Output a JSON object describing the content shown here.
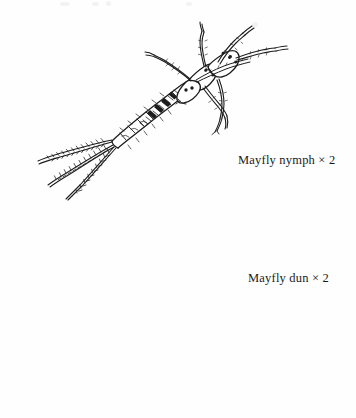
{
  "page": {
    "background_color": "#fefefe",
    "ink_color": "#1a1a1a",
    "width": 356,
    "height": 418,
    "kind": "scanned-illustration-plate"
  },
  "figures": [
    {
      "id": "mayfly-nymph",
      "caption": "Mayfly nymph  × 2",
      "subject": "Mayfly nymph",
      "magnification": "× 2",
      "orientation": "diagonal, head upper-right, tails lower-left",
      "tails": 3,
      "legs": 6,
      "style": "pen-and-ink line drawing"
    },
    {
      "id": "mayfly-dun",
      "caption": "Mayfly dun  × 2",
      "subject": "Mayfly dun",
      "magnification": "× 2",
      "orientation": "side view, head lower-left, tails sweeping upper-right",
      "tails": 3,
      "legs": 6,
      "wings": "large speckled upright forewing with smaller hindwing",
      "style": "pen-and-ink line drawing"
    }
  ],
  "captions": {
    "nymph": "Mayfly nymph  × 2",
    "dun": "Mayfly dun  × 2"
  }
}
